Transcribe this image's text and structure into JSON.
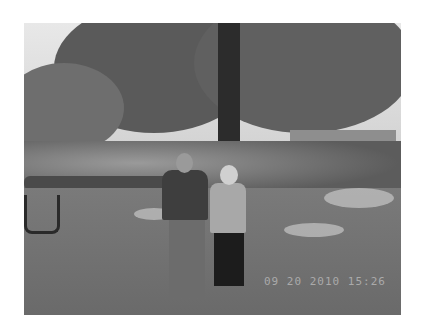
{
  "image": {
    "description": "Black-and-white photograph of an older man and woman standing on a lawn under a large tree, with shrubs, a small building, and a chair in the background",
    "timestamp_overlay": "09 20 2010 15:26"
  }
}
